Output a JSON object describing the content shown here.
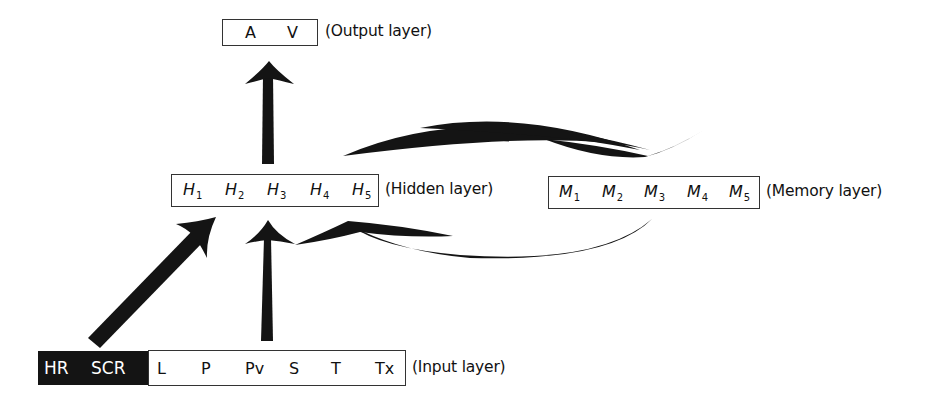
{
  "output_layer": {
    "nodes": [
      "A",
      "V"
    ],
    "label": "(Output layer)"
  },
  "hidden_layer": {
    "nodes": [
      {
        "base": "H",
        "sub": "1"
      },
      {
        "base": "H",
        "sub": "2"
      },
      {
        "base": "H",
        "sub": "3"
      },
      {
        "base": "H",
        "sub": "4"
      },
      {
        "base": "H",
        "sub": "5"
      }
    ],
    "label": "(Hidden layer)"
  },
  "memory_layer": {
    "nodes": [
      {
        "base": "M",
        "sub": "1"
      },
      {
        "base": "M",
        "sub": "2"
      },
      {
        "base": "M",
        "sub": "3"
      },
      {
        "base": "M",
        "sub": "4"
      },
      {
        "base": "M",
        "sub": "5"
      }
    ],
    "label": "(Memory layer)"
  },
  "input_layer": {
    "highlighted_nodes": [
      "HR",
      "SCR"
    ],
    "nodes": [
      "L",
      "P",
      "Pv",
      "S",
      "T",
      "Tx"
    ],
    "label": "(Input layer)"
  },
  "colors": {
    "arrow": "#141414",
    "highlight_bg": "#141414",
    "highlight_fg": "#ffffff",
    "border": "#333333"
  }
}
